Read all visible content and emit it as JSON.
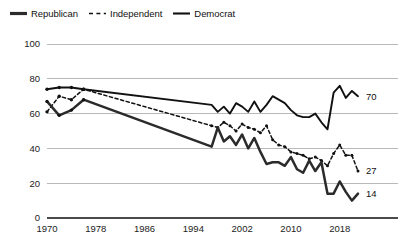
{
  "legend": {
    "items": [
      {
        "label": "Republican",
        "style": "solid-thick",
        "icon": "line-solid-thick-icon"
      },
      {
        "label": "Independent",
        "style": "dashed",
        "icon": "line-dashed-icon"
      },
      {
        "label": "Democrat",
        "style": "solid",
        "icon": "line-solid-icon"
      }
    ]
  },
  "axes": {
    "y_ticks": [
      "0",
      "20",
      "40",
      "60",
      "80",
      "100"
    ],
    "x_ticks": [
      "1970",
      "1978",
      "1986",
      "1994",
      "2002",
      "2010",
      "2018"
    ]
  },
  "end_labels": {
    "democrat": "70",
    "independent": "27",
    "republican": "14"
  },
  "chart_data": {
    "type": "line",
    "title": "",
    "subtitle": "",
    "xlabel": "",
    "ylabel": "",
    "xlim": [
      1970,
      2021
    ],
    "ylim": [
      0,
      100
    ],
    "grid": true,
    "legend_position": "top-left",
    "x_tick_values": [
      1970,
      1978,
      1986,
      1994,
      2002,
      2010,
      2018
    ],
    "y_tick_values": [
      0,
      20,
      40,
      60,
      80,
      100
    ],
    "annotations": [
      {
        "text": "70",
        "series": "Democrat",
        "x": 2021,
        "y": 70
      },
      {
        "text": "27",
        "series": "Independent",
        "x": 2021,
        "y": 27
      },
      {
        "text": "14",
        "series": "Republican",
        "x": 2021,
        "y": 14
      }
    ],
    "series": [
      {
        "name": "Democrat",
        "style": "solid",
        "color": "#111111",
        "points": [
          [
            1970,
            74
          ],
          [
            1972,
            75
          ],
          [
            1974,
            75
          ],
          [
            1976,
            74
          ],
          [
            1997,
            65
          ],
          [
            1998,
            61
          ],
          [
            1999,
            64
          ],
          [
            2000,
            60
          ],
          [
            2001,
            66
          ],
          [
            2002,
            64
          ],
          [
            2003,
            61
          ],
          [
            2004,
            67
          ],
          [
            2005,
            61
          ],
          [
            2006,
            65
          ],
          [
            2007,
            70
          ],
          [
            2008,
            68
          ],
          [
            2009,
            66
          ],
          [
            2010,
            62
          ],
          [
            2011,
            59
          ],
          [
            2012,
            58
          ],
          [
            2013,
            58
          ],
          [
            2014,
            60
          ],
          [
            2015,
            55
          ],
          [
            2016,
            51
          ],
          [
            2017,
            72
          ],
          [
            2018,
            76
          ],
          [
            2019,
            69
          ],
          [
            2020,
            73
          ],
          [
            2021,
            70
          ]
        ]
      },
      {
        "name": "Independent",
        "style": "dashed",
        "color": "#111111",
        "points": [
          [
            1970,
            61
          ],
          [
            1972,
            70
          ],
          [
            1974,
            68
          ],
          [
            1976,
            74
          ],
          [
            1997,
            53
          ],
          [
            1998,
            52
          ],
          [
            1999,
            55
          ],
          [
            2000,
            53
          ],
          [
            2001,
            50
          ],
          [
            2002,
            54
          ],
          [
            2003,
            52
          ],
          [
            2004,
            51
          ],
          [
            2005,
            49
          ],
          [
            2006,
            53
          ],
          [
            2007,
            45
          ],
          [
            2008,
            42
          ],
          [
            2009,
            41
          ],
          [
            2010,
            38
          ],
          [
            2011,
            37
          ],
          [
            2012,
            36
          ],
          [
            2013,
            34
          ],
          [
            2014,
            35
          ],
          [
            2015,
            33
          ],
          [
            2016,
            30
          ],
          [
            2017,
            37
          ],
          [
            2018,
            42
          ],
          [
            2019,
            36
          ],
          [
            2020,
            36
          ],
          [
            2021,
            27
          ]
        ]
      },
      {
        "name": "Republican",
        "style": "solid-thick",
        "color": "#2b2b2b",
        "points": [
          [
            1970,
            67
          ],
          [
            1972,
            59
          ],
          [
            1974,
            62
          ],
          [
            1976,
            68
          ],
          [
            1997,
            41
          ],
          [
            1998,
            52
          ],
          [
            1999,
            44
          ],
          [
            2000,
            47
          ],
          [
            2001,
            42
          ],
          [
            2002,
            48
          ],
          [
            2003,
            40
          ],
          [
            2004,
            46
          ],
          [
            2005,
            38
          ],
          [
            2006,
            31
          ],
          [
            2007,
            32
          ],
          [
            2008,
            32
          ],
          [
            2009,
            30
          ],
          [
            2010,
            35
          ],
          [
            2011,
            28
          ],
          [
            2012,
            26
          ],
          [
            2013,
            33
          ],
          [
            2014,
            27
          ],
          [
            2015,
            32
          ],
          [
            2016,
            14
          ],
          [
            2017,
            14
          ],
          [
            2018,
            21
          ],
          [
            2019,
            15
          ],
          [
            2020,
            10
          ],
          [
            2021,
            14
          ]
        ]
      }
    ]
  }
}
